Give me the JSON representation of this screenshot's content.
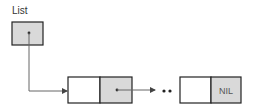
{
  "diagram": {
    "title_label": "List",
    "head_pointer": {
      "name": "List",
      "fill": "#d9d9d9"
    },
    "nodes": [
      {
        "data": "",
        "next": "pointer",
        "next_fill": "#d9d9d9"
      },
      {
        "data": "",
        "next": "NIL",
        "next_fill": "#d9d9d9"
      }
    ],
    "ellipsis": "••",
    "nil_label": "NIL",
    "colors": {
      "stroke": "#222222",
      "line": "#555555",
      "cell_empty": "#ffffff",
      "cell_shaded": "#d9d9d9"
    }
  }
}
